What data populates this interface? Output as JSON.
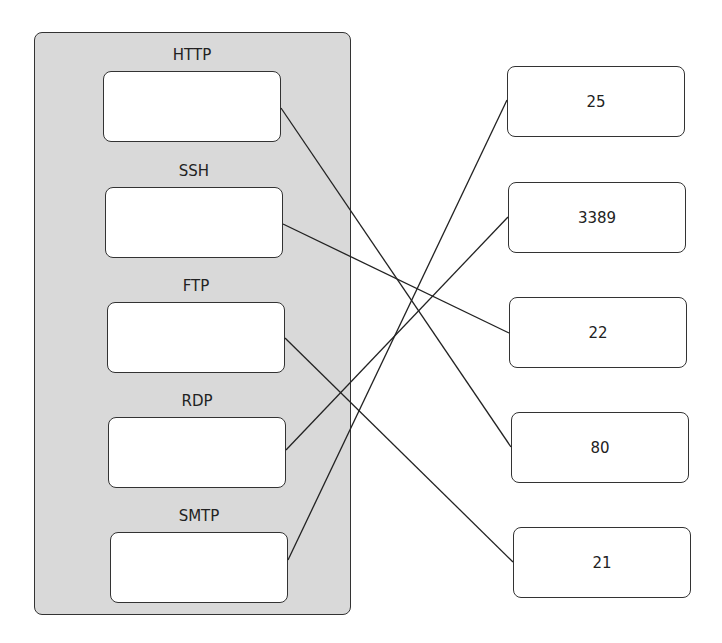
{
  "diagram": {
    "protocols": [
      {
        "label": "HTTP"
      },
      {
        "label": "SSH"
      },
      {
        "label": "FTP"
      },
      {
        "label": "RDP"
      },
      {
        "label": "SMTP"
      }
    ],
    "ports": [
      {
        "label": "25"
      },
      {
        "label": "3389"
      },
      {
        "label": "22"
      },
      {
        "label": "80"
      },
      {
        "label": "21"
      }
    ],
    "connections": [
      {
        "from": "HTTP",
        "to": "80"
      },
      {
        "from": "SSH",
        "to": "22"
      },
      {
        "from": "FTP",
        "to": "21"
      },
      {
        "from": "RDP",
        "to": "3389"
      },
      {
        "from": "SMTP",
        "to": "25"
      }
    ]
  }
}
